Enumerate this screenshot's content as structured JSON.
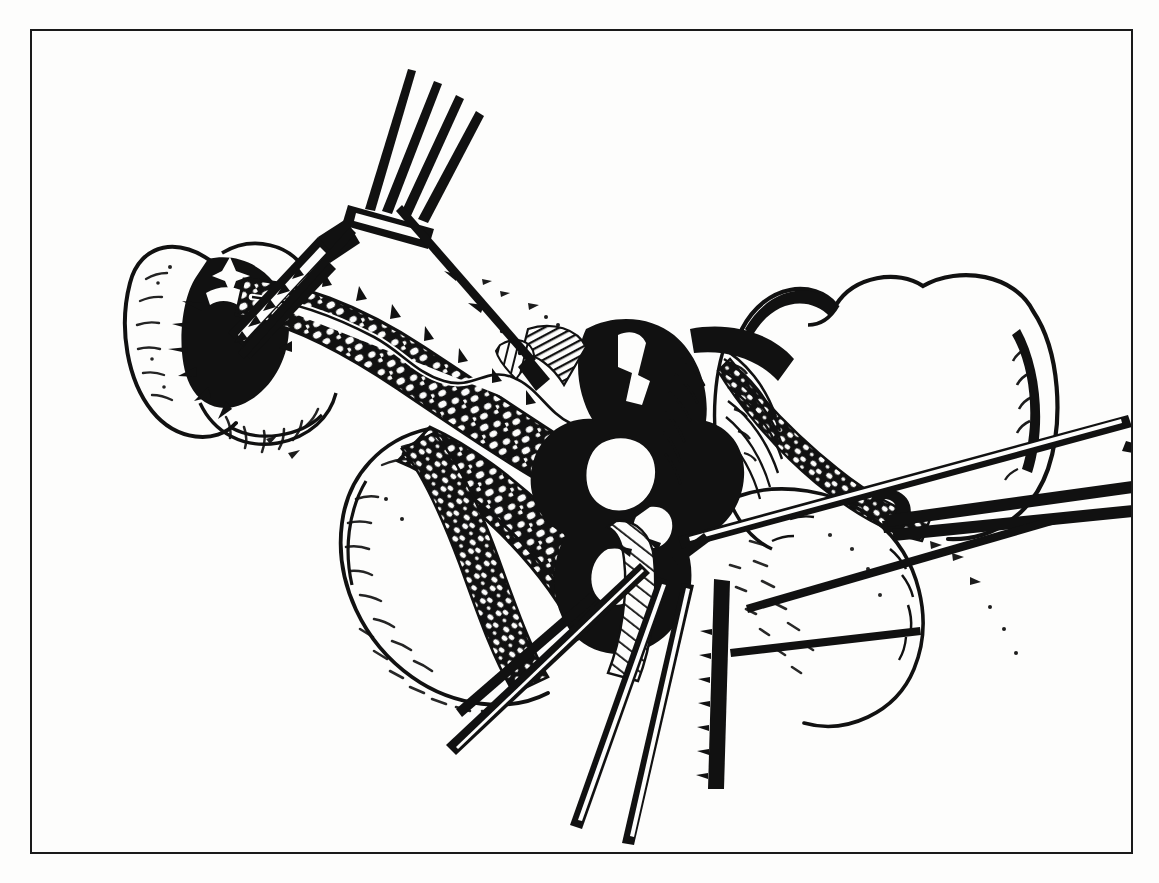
{
  "page": {
    "width": 1159,
    "height": 883,
    "background_color": "#fdfdfc",
    "paper_tone": "off-white scanned book page"
  },
  "frame": {
    "name": "illustration-border",
    "color": "#1a1a1a",
    "border_width_px": 2.5,
    "left": 30,
    "top": 29,
    "width": 1103,
    "height": 825
  },
  "figure": {
    "title": "",
    "caption": "",
    "figure_number": "",
    "style": "black-and-white pen-and-ink line drawing",
    "ink_color": "#111111",
    "description": "Operative exposure showing the duodenum and pancreas retracted by a four-prong rake retractor at upper left, a lymph-node bearing vascular pedicle dissected along the centre, adjacent bowel loops at right, a clamp applied across a vessel at right, and several clamp/forceps shafts converging at lower centre."
  },
  "bleed_through": {
    "note": "faint mirrored show-through of body text printed on the reverse of the page",
    "opacity": 0.055,
    "left_column_text": "the lesser sac is entered and the posterior wall of the stomach is elevated with the gastric retractor so that the body of the pancreas may be inspected along its entire length. The dissection is carried upward along the superior border of the pancreas where the common hepatic artery and the splenic artery are identified. The lymph nodes along the hepatic artery and those about the celiac axis are removed en bloc with the specimen whenever this is technically feasible.",
    "right_column_text": "pancreas. The retroperitoneal attachments of the duodenum are divided with the scissors and the duodenum together with the head of the pancreas is mobilized medially so that the inferior vena cava and the aorta may be palpated directly. The superior mesenteric vein is exposed below the neck of the pancreas and a plane is developed bluntly between the vein and the overlying gland."
  },
  "instruments": [
    {
      "name": "rake-retractor",
      "prongs": 4,
      "position": "upper left",
      "label": "four-prong rake retractor"
    },
    {
      "name": "dissecting-forceps",
      "position": "upper left, beneath retractor",
      "label": "dissecting forceps"
    },
    {
      "name": "long-clamp-right",
      "position": "right, crossing vessel",
      "label": "long curved clamp"
    },
    {
      "name": "clamp-cluster-bottom",
      "count": 4,
      "position": "lower centre",
      "label": "clamp and forceps shafts"
    },
    {
      "name": "probe-lower-right",
      "position": "lower right",
      "label": "fine probe"
    }
  ],
  "anatomy": [
    {
      "name": "duodenum",
      "position": "upper left"
    },
    {
      "name": "pancreas-head",
      "position": "left of centre"
    },
    {
      "name": "lymph-node-chain",
      "position": "centre, along vascular pedicle"
    },
    {
      "name": "vascular-pedicle",
      "position": "centre"
    },
    {
      "name": "bowel-loop-right",
      "position": "right"
    },
    {
      "name": "bowel-loop-lower-right",
      "position": "lower right"
    },
    {
      "name": "bowel-loop-lower-left",
      "position": "lower left"
    }
  ]
}
